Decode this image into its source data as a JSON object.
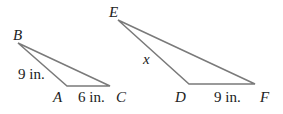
{
  "figure": {
    "triangle1": {
      "vertices": {
        "B": "B",
        "A": "A",
        "C": "C"
      },
      "side_BA": "9 in.",
      "side_AC": "6 in."
    },
    "triangle2": {
      "vertices": {
        "E": "E",
        "D": "D",
        "F": "F"
      },
      "side_ED": "x",
      "side_DF": "9 in."
    },
    "colors": {
      "line": "#7a7a7a",
      "text": "#222222"
    }
  }
}
